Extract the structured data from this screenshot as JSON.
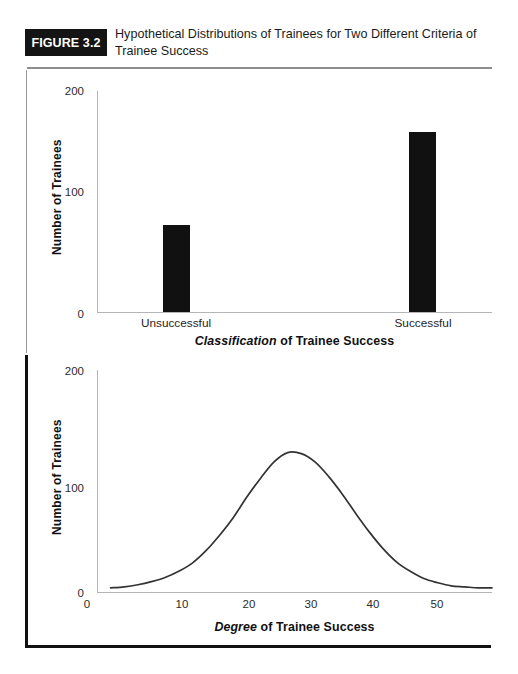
{
  "figure": {
    "badge_label": "FIGURE 3.2",
    "title": "Hypothetical Distributions of Trainees for Two Different Criteria of Trainee Success",
    "badge_bg": "#141414",
    "ink": "#111111",
    "rule_color": "#8e8e8e"
  },
  "chart_data": [
    {
      "type": "bar",
      "id": "classification-bar-chart",
      "title": "",
      "categories": [
        "Unsuccessful",
        "Successful"
      ],
      "values": [
        85,
        175
      ],
      "xlabel_rich": {
        "emphasis": "Classification",
        "rest": " of Trainee Success"
      },
      "xlabel": "Classification of Trainee Success",
      "ylabel": "Number of Trainees",
      "ylim": [
        0,
        215
      ],
      "yticks": [
        0,
        100,
        200
      ],
      "ytick_labels": [
        "0",
        "100",
        "200"
      ],
      "grid": false,
      "legend": "none",
      "bar_color": "#111111"
    },
    {
      "type": "line",
      "id": "degree-distribution-curve",
      "title": "",
      "xlabel_rich": {
        "emphasis": "Degree",
        "rest": " of Trainee Success"
      },
      "xlabel": "Degree of Trainee Success",
      "ylabel": "Number of Trainees",
      "xlim": [
        0,
        58
      ],
      "ylim": [
        0,
        215
      ],
      "xticks": [
        0,
        10,
        20,
        30,
        40,
        50
      ],
      "xtick_labels": [
        "0",
        "10",
        "20",
        "30",
        "40",
        "50"
      ],
      "yticks": [
        0,
        100,
        200
      ],
      "ytick_labels": [
        "0",
        "100",
        "200"
      ],
      "grid": false,
      "legend": "none",
      "line_color": "#333333",
      "distribution": {
        "shape": "normal",
        "mean": 28,
        "sigma": 9.2,
        "peak_value": 135
      },
      "x": [
        2,
        4,
        6,
        8,
        10,
        12,
        14,
        16,
        18,
        20,
        22,
        24,
        26,
        28,
        30,
        32,
        34,
        36,
        38,
        40,
        42,
        44,
        46,
        48,
        50,
        52,
        54,
        56,
        58
      ],
      "y": [
        4,
        5,
        7,
        10,
        14,
        20,
        28,
        40,
        55,
        72,
        92,
        110,
        126,
        135,
        134,
        126,
        112,
        95,
        76,
        58,
        42,
        29,
        20,
        13,
        9,
        6,
        5,
        4,
        4
      ]
    }
  ]
}
